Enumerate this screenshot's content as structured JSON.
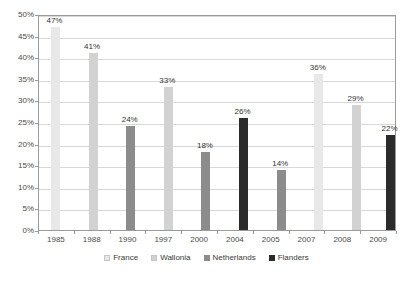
{
  "chart_data": {
    "type": "bar",
    "title": "",
    "subtitle": "",
    "xlabel": "",
    "ylabel": "",
    "ylim": [
      0,
      50
    ],
    "y_unit": "%",
    "grid": true,
    "legend_position": "bottom",
    "categories": [
      "1985",
      "1988",
      "1990",
      "1997",
      "2000",
      "2004",
      "2005",
      "2007",
      "2008",
      "2009"
    ],
    "values": [
      47,
      41,
      24,
      33,
      18,
      26,
      14,
      36,
      29,
      22
    ],
    "data_labels": [
      "47%",
      "41%",
      "24%",
      "33%",
      "18%",
      "26%",
      "14%",
      "36%",
      "29%",
      "22%"
    ],
    "point_series": [
      "France",
      "Wallonia",
      "Netherlands",
      "Wallonia",
      "Netherlands",
      "Flanders",
      "Netherlands",
      "France",
      "Wallonia",
      "Flanders"
    ],
    "y_ticks": [
      0,
      5,
      10,
      15,
      20,
      25,
      30,
      35,
      40,
      45,
      50
    ],
    "y_tick_labels": [
      "0%",
      "5%",
      "10%",
      "15%",
      "20%",
      "25%",
      "30%",
      "35%",
      "40%",
      "45%",
      "50%"
    ],
    "series": [
      {
        "name": "France",
        "color": "#e8e8e8",
        "values": [
          47,
          null,
          null,
          null,
          null,
          null,
          null,
          36,
          null,
          null
        ]
      },
      {
        "name": "Wallonia",
        "color": "#d2d2d2",
        "values": [
          null,
          41,
          null,
          33,
          null,
          null,
          null,
          null,
          29,
          null
        ]
      },
      {
        "name": "Netherlands",
        "color": "#8c8c8c",
        "values": [
          null,
          null,
          24,
          null,
          18,
          null,
          14,
          null,
          null,
          null
        ]
      },
      {
        "name": "Flanders",
        "color": "#2b2b2b",
        "values": [
          null,
          null,
          null,
          null,
          null,
          26,
          null,
          null,
          null,
          22
        ]
      }
    ],
    "legend": [
      {
        "label": "France",
        "color": "#e8e8e8"
      },
      {
        "label": "Wallonia",
        "color": "#d2d2d2"
      },
      {
        "label": "Netherlands",
        "color": "#8c8c8c"
      },
      {
        "label": "Flanders",
        "color": "#2b2b2b"
      }
    ]
  },
  "colors": {
    "plot_border": "#9a9a9a",
    "gridline": "#d8d8d8",
    "background": "#ffffff",
    "text": "#3a3a3a"
  }
}
